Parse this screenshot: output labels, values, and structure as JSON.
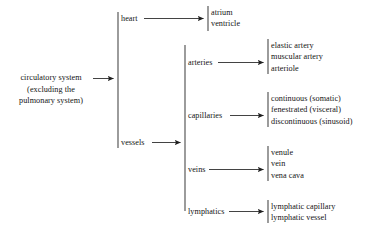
{
  "diagram": {
    "type": "hierarchy-tree",
    "root": {
      "label_line1": "circulatory system",
      "label_line2": "(excluding the",
      "label_line3": "pulmonary system)"
    },
    "level1": [
      {
        "label": "heart"
      },
      {
        "label": "vessels"
      }
    ],
    "heart_leaves": [
      "atrium",
      "ventricle"
    ],
    "level2": [
      {
        "label": "arteries"
      },
      {
        "label": "capillaries"
      },
      {
        "label": "veins"
      },
      {
        "label": "lymphatics"
      }
    ],
    "arteries_leaves": [
      "elastic artery",
      "muscular artery",
      "arteriole"
    ],
    "capillaries_leaves": [
      "continuous (somatic)",
      "fenestrated (visceral)",
      "discontinuous (sinusoid)"
    ],
    "veins_leaves": [
      "venule",
      "vein",
      "vena cava"
    ],
    "lymphatics_leaves": [
      "lymphatic capillary",
      "lymphatic vessel"
    ],
    "colors": {
      "background": "#ffffff",
      "text": "#141414",
      "bar": "#4a4a4a",
      "connector": "#2e2e2e"
    }
  }
}
